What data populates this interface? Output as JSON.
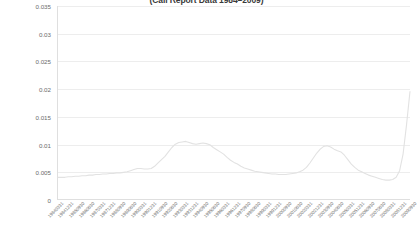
{
  "chart_data": {
    "type": "line",
    "title": "(Call Report Data 1984–2009)",
    "xlabel": "",
    "ylabel": "",
    "ylim": [
      0,
      0.035
    ],
    "grid": true,
    "legend": false,
    "y_ticks": [
      "0.035",
      "0.03",
      "0.025",
      "0.02",
      "0.015",
      "0.01",
      "0.005",
      "0"
    ],
    "y_tick_values": [
      0.035,
      0.03,
      0.025,
      0.02,
      0.015,
      0.01,
      0.005,
      0
    ],
    "series_color": "#e2e2e2",
    "x_tick_labels": [
      "19840331",
      "19841231",
      "19850930",
      "19860630",
      "19870331",
      "19871231",
      "19880930",
      "19890630",
      "19900331",
      "19901231",
      "19910930",
      "19920630",
      "19930331",
      "19931231",
      "19940930",
      "19950630",
      "19960331",
      "19961231",
      "19970930",
      "19980630",
      "19990331",
      "19991231",
      "20000930",
      "20010630",
      "20020331",
      "20021231",
      "20030930",
      "20040630",
      "20050331",
      "20051231",
      "20060930",
      "20070630",
      "20080331",
      "20081231",
      "20090930"
    ],
    "categories": [
      "19840331",
      "19840630",
      "19840930",
      "19841231",
      "19850331",
      "19850630",
      "19850930",
      "19851231",
      "19860331",
      "19860630",
      "19860930",
      "19861231",
      "19870331",
      "19870630",
      "19870930",
      "19871231",
      "19880331",
      "19880630",
      "19880930",
      "19881231",
      "19890331",
      "19890630",
      "19890930",
      "19891231",
      "19900331",
      "19900630",
      "19900930",
      "19901231",
      "19910331",
      "19910630",
      "19910930",
      "19911231",
      "19920331",
      "19920630",
      "19920930",
      "19921231",
      "19930331",
      "19930630",
      "19930930",
      "19931231",
      "19940331",
      "19940630",
      "19940930",
      "19941231",
      "19950331",
      "19950630",
      "19950930",
      "19951231",
      "19960331",
      "19960630",
      "19960930",
      "19961231",
      "19970331",
      "19970630",
      "19970930",
      "19971231",
      "19980331",
      "19980630",
      "19980930",
      "19981231",
      "19990331",
      "19990630",
      "19990930",
      "19991231",
      "20000331",
      "20000630",
      "20000930",
      "20001231",
      "20010331",
      "20010630",
      "20010930",
      "20011231",
      "20020331",
      "20020630",
      "20020930",
      "20021231",
      "20030331",
      "20030630",
      "20030930",
      "20031231",
      "20040331",
      "20040630",
      "20040930",
      "20041231",
      "20050331",
      "20050630",
      "20050930",
      "20051231",
      "20060331",
      "20060630",
      "20060930",
      "20061231",
      "20070331",
      "20070630",
      "20070930",
      "20071231",
      "20080331",
      "20080630",
      "20080930",
      "20081231",
      "20090331",
      "20090630",
      "20090930"
    ],
    "values": [
      0.004,
      0.004,
      0.004,
      0.0041,
      0.0041,
      0.0042,
      0.0042,
      0.0043,
      0.0043,
      0.0044,
      0.0044,
      0.0045,
      0.0045,
      0.0046,
      0.0046,
      0.0047,
      0.0047,
      0.0048,
      0.0048,
      0.0049,
      0.005,
      0.0052,
      0.0054,
      0.0056,
      0.0056,
      0.0055,
      0.0055,
      0.0056,
      0.006,
      0.0066,
      0.0072,
      0.0078,
      0.0086,
      0.0094,
      0.01,
      0.0103,
      0.0104,
      0.0105,
      0.0103,
      0.0101,
      0.01,
      0.0101,
      0.0102,
      0.0101,
      0.0099,
      0.0094,
      0.009,
      0.0086,
      0.0082,
      0.0076,
      0.0071,
      0.0067,
      0.0064,
      0.006,
      0.0057,
      0.0055,
      0.0053,
      0.0051,
      0.005,
      0.0049,
      0.0048,
      0.0047,
      0.0046,
      0.0046,
      0.0045,
      0.0045,
      0.0045,
      0.0046,
      0.0047,
      0.0048,
      0.005,
      0.0053,
      0.0058,
      0.0066,
      0.0075,
      0.0084,
      0.0091,
      0.0096,
      0.0097,
      0.0095,
      0.0091,
      0.0088,
      0.0086,
      0.008,
      0.0072,
      0.0064,
      0.0058,
      0.0053,
      0.005,
      0.0047,
      0.0044,
      0.0042,
      0.004,
      0.0038,
      0.0036,
      0.0035,
      0.0035,
      0.0036,
      0.004,
      0.0052,
      0.0082,
      0.0135,
      0.0195
    ]
  }
}
